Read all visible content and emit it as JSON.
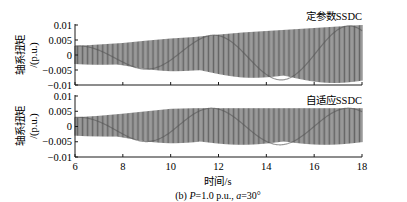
{
  "chart_data": [
    {
      "type": "line",
      "panel": "top",
      "title": "定参数SSDC",
      "xlabel": "时间/s",
      "ylabel": "轴系扭矩/(p.u.)",
      "xlim": [
        6,
        18
      ],
      "ylim": [
        -0.01,
        0.01
      ],
      "yticks": [
        "0.01",
        "0.005",
        "0",
        "-0.005",
        "-0.01"
      ],
      "xticks": [
        "6",
        "8",
        "10",
        "12",
        "14",
        "16",
        "18"
      ],
      "grid": false,
      "series": [
        {
          "name": "定参数SSDC",
          "description": "high-frequency oscillation with growing envelope (beating pattern)",
          "x": [
            6,
            7,
            8,
            9,
            10,
            11,
            12,
            13,
            14,
            15,
            16,
            17,
            18
          ],
          "envelope_upper": [
            0.003,
            0.0035,
            0.004,
            0.0048,
            0.0055,
            0.006,
            0.0068,
            0.0075,
            0.008,
            0.0085,
            0.009,
            0.0095,
            0.01
          ],
          "envelope_lower": [
            -0.003,
            -0.0035,
            -0.004,
            -0.0048,
            -0.0055,
            -0.006,
            -0.0068,
            -0.0075,
            -0.008,
            -0.0085,
            -0.009,
            -0.0095,
            -0.01
          ]
        }
      ]
    },
    {
      "type": "line",
      "panel": "bottom",
      "title": "自适应SSDC",
      "xlabel": "时间/s",
      "ylabel": "轴系扭矩/(p.u.)",
      "xlim": [
        6,
        18
      ],
      "ylim": [
        -0.01,
        0.01
      ],
      "yticks": [
        "0.01",
        "0.005",
        "0",
        "-0.005",
        "-0.01"
      ],
      "xticks": [
        "6",
        "8",
        "10",
        "12",
        "14",
        "16",
        "18"
      ],
      "grid": false,
      "series": [
        {
          "name": "自适应SSDC",
          "description": "high-frequency oscillation whose envelope grows then is limited near ±0.006",
          "x": [
            6,
            7,
            8,
            9,
            10,
            11,
            12,
            13,
            14,
            15,
            16,
            17,
            18
          ],
          "envelope_upper": [
            0.003,
            0.0035,
            0.0042,
            0.005,
            0.0058,
            0.006,
            0.006,
            0.006,
            0.006,
            0.006,
            0.006,
            0.006,
            0.006
          ],
          "envelope_lower": [
            -0.003,
            -0.0035,
            -0.0042,
            -0.005,
            -0.0056,
            -0.006,
            -0.006,
            -0.006,
            -0.006,
            -0.006,
            -0.006,
            -0.006,
            -0.006
          ]
        }
      ]
    }
  ],
  "figure": {
    "xlabel": "时间/s",
    "caption": "(b)  P=1.0 p.u., a=30°",
    "caption_parts": {
      "prefix": "(b)  ",
      "p_var": "P",
      "p_val": "=1.0 p.u., ",
      "a_var": "a",
      "a_val": "=30°"
    }
  },
  "top": {
    "label": "定参数SSDC",
    "ylabel_line1": "轴系扭矩",
    "ylabel_line2": "/(p.u.)"
  },
  "bottom": {
    "label": "自适应SSDC",
    "ylabel_line1": "轴系扭矩",
    "ylabel_line2": "/(p.u.)"
  },
  "ticks": {
    "y": [
      "0.01",
      "0.005",
      "0",
      "−0.005",
      "−0.01"
    ],
    "x": [
      "6",
      "8",
      "10",
      "12",
      "14",
      "16",
      "18"
    ]
  },
  "colors": {
    "trace": "#2a2a2a",
    "axis": "#1a1a1a",
    "background": "#ffffff"
  }
}
